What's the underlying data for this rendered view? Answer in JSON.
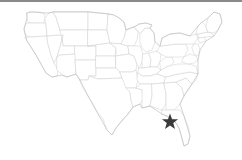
{
  "figure": {
    "kind": "locator-map",
    "region": "united-states-lower-48",
    "background_color": "#ffffff",
    "top_rule_color": "#8a8a8a",
    "state_border_color": "#d2d2d2",
    "nation_outline_color": "#c0c0c0",
    "state_fill_color": "#ffffff"
  },
  "marker": {
    "icon": "star-icon",
    "color": "#3a3a3a",
    "x": 170,
    "y": 122,
    "size": 17,
    "label": ""
  },
  "map_content": {
    "title": "",
    "caption": "",
    "legend": [],
    "labels": []
  }
}
